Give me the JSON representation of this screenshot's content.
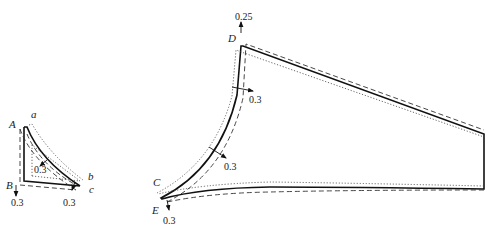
{
  "figure": {
    "legend_styles": {
      "solid": "original shape",
      "dashed": "displaced shape 1",
      "dotted": "displaced shape 2"
    }
  },
  "small_section": {
    "points": {
      "A": "A",
      "B": "B",
      "a": "a",
      "b": "b",
      "c": "c"
    },
    "annotations": [
      {
        "id": "inner",
        "value": "0.3"
      },
      {
        "id": "B_down",
        "value": "0.3"
      },
      {
        "id": "c_down",
        "value": "0.3"
      }
    ]
  },
  "large_section": {
    "points": {
      "C": "C",
      "D": "D",
      "E": "E"
    },
    "annotations": [
      {
        "id": "D_up",
        "value": "0.25"
      },
      {
        "id": "web_upper",
        "value": "0.3"
      },
      {
        "id": "web_lower",
        "value": "0.3"
      },
      {
        "id": "E_down",
        "value": "0.3"
      }
    ]
  }
}
